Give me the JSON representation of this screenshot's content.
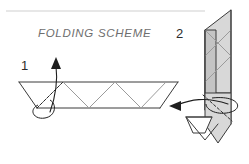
{
  "figure": {
    "title": "FOLDING SCHEME",
    "title_color": "#6e6e6e",
    "background_color": "#ffffff",
    "steps": [
      {
        "label": "1",
        "name": "step-one"
      },
      {
        "label": "2",
        "name": "step-two"
      }
    ],
    "line_colors": {
      "solid_edge": "#3a3a3a",
      "fold_line": "#9b9b9b",
      "dashed_fold": "#2b2b2b",
      "arrow": "#1f1f1f",
      "divider_rule": "#cfcfcf",
      "panel_light": "#d8d8d8",
      "panel_mid": "#c4c4c4",
      "panel_white": "#ffffff"
    },
    "elements": {
      "divider_rule": "horizontal-rule",
      "flat_pattern": "trapezoid-zigzag-crease-pattern",
      "folded_model": "vertical-folded-model",
      "arrow_step_one": "curved-fold-arrow-up",
      "arrow_step_two": "curved-wrap-around-arrow-left"
    }
  }
}
